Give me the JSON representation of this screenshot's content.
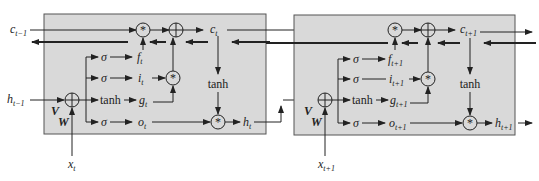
{
  "diagram": {
    "cells": [
      {
        "c_in": {
          "base": "c",
          "sub": "t−1"
        },
        "h_in": {
          "base": "h",
          "sub": "t−1"
        },
        "x": {
          "base": "x",
          "sub": "t"
        },
        "c_out": {
          "base": "c",
          "sub": "t"
        },
        "h_out": {
          "base": "h",
          "sub": "t"
        },
        "gates": {
          "f": {
            "base": "f",
            "sub": "t"
          },
          "i": {
            "base": "i",
            "sub": "t"
          },
          "g": {
            "base": "g",
            "sub": "t"
          },
          "o": {
            "base": "o",
            "sub": "t"
          }
        }
      },
      {
        "x": {
          "base": "x",
          "sub": "t+1"
        },
        "c_out": {
          "base": "c",
          "sub": "t+1"
        },
        "h_out": {
          "base": "h",
          "sub": "t+1"
        },
        "gates": {
          "f": {
            "base": "f",
            "sub": "t+1"
          },
          "i": {
            "base": "i",
            "sub": "t+1"
          },
          "g": {
            "base": "g",
            "sub": "t+1"
          },
          "o": {
            "base": "o",
            "sub": "t+1"
          }
        }
      }
    ],
    "labels": {
      "sigma": "σ",
      "tanh": "tanh",
      "V": "V",
      "W": "W",
      "mul": "*"
    },
    "colors": {
      "cell_fill": "#d9d9d9",
      "line": "#222222"
    }
  }
}
